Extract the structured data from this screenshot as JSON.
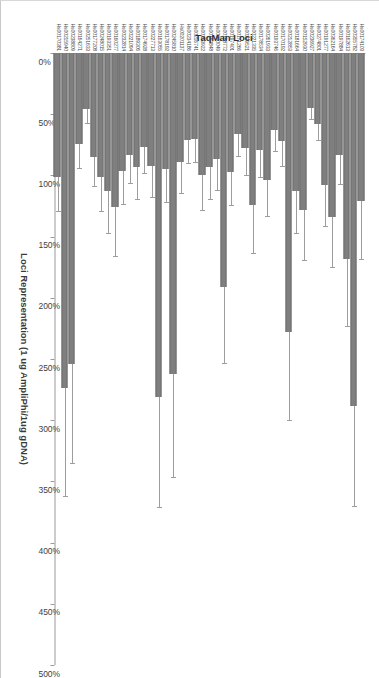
{
  "figure": {
    "background_color": "#ffffff",
    "bar_color": "#7f7f7f",
    "error_bar_color": "#9d9d9d",
    "axis_color": "#9a9a9a",
    "rotation_degrees": 90
  },
  "chart_data": {
    "type": "bar",
    "orientation": "horizontal",
    "title": "",
    "xlabel": "Loci Representation (1 ug AmpliPhi/1ug gDNA)",
    "ylabel": "TaqMan Loci",
    "xlim": [
      0,
      500
    ],
    "xtick_labels": [
      "0%",
      "50%",
      "100%",
      "150%",
      "200%",
      "250%",
      "300%",
      "350%",
      "400%",
      "450%",
      "500%"
    ],
    "xticks": [
      0,
      50,
      100,
      150,
      200,
      250,
      300,
      350,
      400,
      450,
      500
    ],
    "grid": false,
    "legend": null,
    "value_unit": "%",
    "categories": [
      "Hs00174103",
      "Hs00355782",
      "Hs00162613",
      "Hs00197884",
      "Hs00362164",
      "Hs00191277",
      "Hs00274801",
      "Hs00236927",
      "Hs00152930",
      "Hs00181664",
      "Hs00212853",
      "Hs00170192",
      "Hs00193746",
      "Hs00261933",
      "Hs00178534",
      "Hs00221335",
      "Hs00239521",
      "Hs00171266",
      "Hs00197401",
      "Hs00188772",
      "Hs00300049",
      "Hs00163848",
      "Hs00253922",
      "Hs00216741",
      "Hs00234186",
      "Hs00201137",
      "Hs00245810",
      "Hs00178192",
      "Hs00163055",
      "Hs00227713",
      "Hs00174928",
      "Hs00189306",
      "Hs00221094",
      "Hs00232814",
      "Hs00160277",
      "Hs00193351",
      "Hs00248015",
      "Hs00177208",
      "Hs00251633",
      "Hs00164271",
      "Hs00238809",
      "Hs00215940",
      "Hs00170381"
    ],
    "values": [
      121,
      288,
      168,
      83,
      134,
      108,
      58,
      45,
      128,
      113,
      228,
      72,
      63,
      104,
      79,
      124,
      78,
      66,
      97,
      191,
      87,
      93,
      100,
      70,
      71,
      89,
      262,
      95,
      281,
      92,
      77,
      93,
      83,
      96,
      126,
      113,
      101,
      85,
      46,
      74,
      254,
      274,
      101
    ],
    "errors": [
      47,
      82,
      55,
      24,
      41,
      33,
      13,
      9,
      41,
      34,
      72,
      20,
      17,
      29,
      22,
      39,
      22,
      18,
      27,
      62,
      25,
      26,
      28,
      19,
      19,
      25,
      84,
      27,
      90,
      26,
      21,
      26,
      23,
      27,
      40,
      34,
      28,
      24,
      11,
      20,
      81,
      88,
      28
    ],
    "series_note": "Mean loci representation with error bars"
  },
  "axis_titles": {
    "value": "Loci Representation (1 ug AmpliPhi/1ug gDNA)",
    "category": "TaqMan Loci"
  }
}
